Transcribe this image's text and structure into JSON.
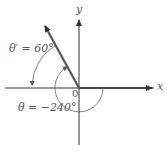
{
  "diagram": {
    "x_axis_label": "x",
    "y_axis_label": "y",
    "origin_label": "0",
    "reference_angle_label": "θ′ = 60°",
    "angle_label": "θ = −240°",
    "colors": {
      "axis": "#333333",
      "terminal_ray": "#555555",
      "arc": "#666666"
    }
  }
}
